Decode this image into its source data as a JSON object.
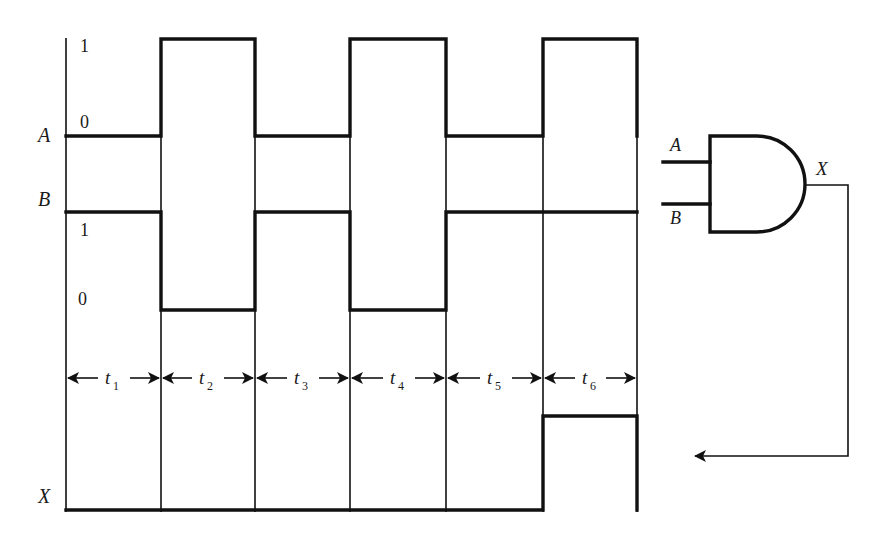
{
  "diagram": {
    "signals": {
      "A": {
        "label": "A",
        "level_high_label": "1",
        "level_low_label": "0"
      },
      "B": {
        "label": "B",
        "level_high_label": "1",
        "level_low_label": "0"
      },
      "X": {
        "label": "X"
      }
    },
    "intervals": [
      {
        "label": "t",
        "sub": "1"
      },
      {
        "label": "t",
        "sub": "2"
      },
      {
        "label": "t",
        "sub": "3"
      },
      {
        "label": "t",
        "sub": "4"
      },
      {
        "label": "t",
        "sub": "5"
      },
      {
        "label": "t",
        "sub": "6"
      }
    ],
    "waveforms": {
      "A": [
        0,
        1,
        0,
        1,
        0,
        1
      ],
      "B": [
        1,
        0,
        1,
        0,
        1,
        1
      ],
      "X": [
        0,
        0,
        0,
        0,
        0,
        1
      ]
    },
    "gate": {
      "type": "AND",
      "input_a_label": "A",
      "input_b_label": "B",
      "output_label": "X"
    }
  }
}
